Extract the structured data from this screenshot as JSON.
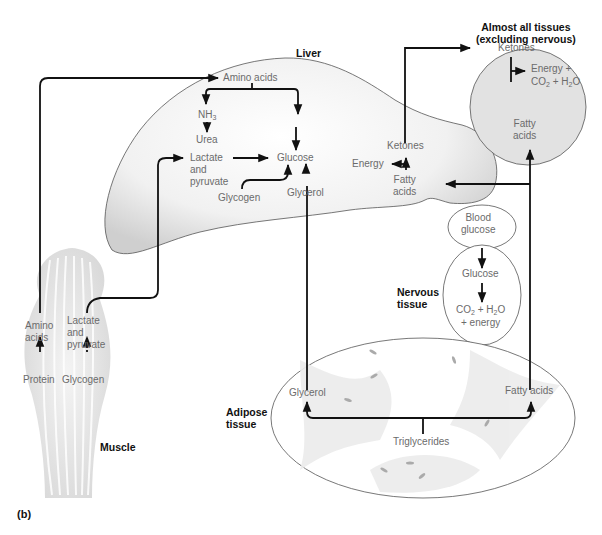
{
  "figure": {
    "panel_label": "(b)",
    "tissues": {
      "liver": {
        "title": "Liver",
        "amino_acids": "Amino acids",
        "nh3": "NH",
        "nh3_sub": "3",
        "urea": "Urea",
        "lactate_l1": "Lactate",
        "lactate_l2": "and",
        "lactate_l3": "pyruvate",
        "glucose": "Glucose",
        "glycogen": "Glycogen",
        "glycerol": "Glycerol",
        "ketones": "Ketones",
        "energy": "Energy",
        "fatty_l1": "Fatty",
        "fatty_l2": "acids"
      },
      "almost_all": {
        "title_l1": "Almost all tissues",
        "title_l2": "(excluding nervous)",
        "ketones": "Ketones",
        "energy_l1": "Energy +",
        "co2": "CO",
        "co2_sub": "2",
        "plus_h": " + H",
        "h2o_sub": "2",
        "o": "O",
        "fatty_l1": "Fatty",
        "fatty_l2": "acids"
      },
      "blood": {
        "l1": "Blood",
        "l2": "glucose"
      },
      "nervous": {
        "title_l1": "Nervous",
        "title_l2": "tissue",
        "glucose": "Glucose",
        "co2": "CO",
        "co2_sub": "2",
        "plus_h": " + H",
        "h2o_sub": "2",
        "o": "O",
        "energy": "+ energy"
      },
      "muscle": {
        "title": "Muscle",
        "amino_l1": "Amino",
        "amino_l2": "acids",
        "lactate_l1": "Lactate",
        "lactate_l2": "and",
        "lactate_l3": "pyruvate",
        "protein": "Protein",
        "glycogen": "Glycogen"
      },
      "adipose": {
        "title_l1": "Adipose",
        "title_l2": "tissue",
        "glycerol": "Glycerol",
        "fatty_acids": "Fatty acids",
        "triglycerides": "Triglycerides"
      }
    },
    "colors": {
      "arrow": "#111111",
      "text": "#6b6b6b",
      "organ_fill": "#e4e4e4",
      "outline": "#555555"
    }
  }
}
